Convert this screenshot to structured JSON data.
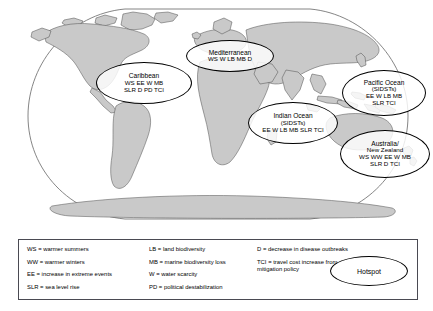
{
  "map": {
    "projection": "robinson",
    "land_color": "#c9c9c9",
    "ocean_color": "#ffffff",
    "outline_color": "#555555"
  },
  "hotspots": [
    {
      "id": "caribbean",
      "title": "Caribbean",
      "subtitle": "",
      "codes_line1": "WS EE W MB",
      "codes_line2": "SLR D PD TCI"
    },
    {
      "id": "mediterranean",
      "title": "Mediterranean",
      "subtitle": "",
      "codes_line1": "WS W LB MB D",
      "codes_line2": ""
    },
    {
      "id": "indian-ocean",
      "title": "Indian Ocean",
      "subtitle": "(SIDSTs)",
      "codes_line1": "EE W LB MB SLR TCI",
      "codes_line2": ""
    },
    {
      "id": "pacific-ocean",
      "title": "Pacific Ocean",
      "subtitle": "(SIDSTs)",
      "codes_line1": "EE W LB MB",
      "codes_line2": "SLR TCI"
    },
    {
      "id": "australia-new-zealand",
      "title": "Australia/",
      "subtitle": "New Zealand",
      "codes_line1": "WS WW EE W MB",
      "codes_line2": "SLR D TCI"
    }
  ],
  "legend": {
    "column1": [
      "WS = warmer summers",
      "WW = warmer winters",
      "EE = increase in extreme events",
      "SLR = sea level rise"
    ],
    "column2": [
      "LB = land biodiversity",
      "MB = marine biodiversity loss",
      "W = water scarcity",
      "PD = political destabilization"
    ],
    "column3": [
      "D = decrease in disease outbreaks",
      "TCI = travel cost increase from\n        mitigation policy"
    ],
    "hotspot_key": "Hotspot"
  }
}
